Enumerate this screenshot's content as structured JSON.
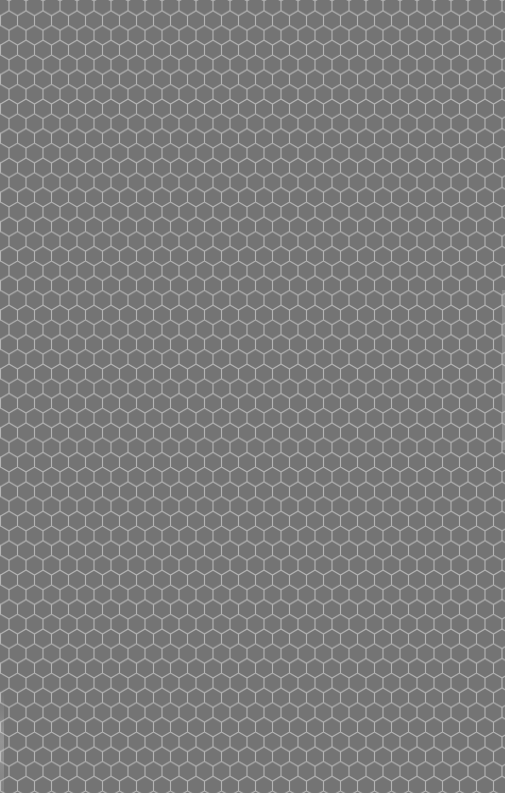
{
  "image": {
    "description": "Grey honeycomb mesh texture",
    "pattern": "hexagon-pointy-top",
    "colors": {
      "background": "#747474",
      "line": "#b4b4b4"
    },
    "cell_width_px": 17,
    "row_period_px": 29.4
  }
}
